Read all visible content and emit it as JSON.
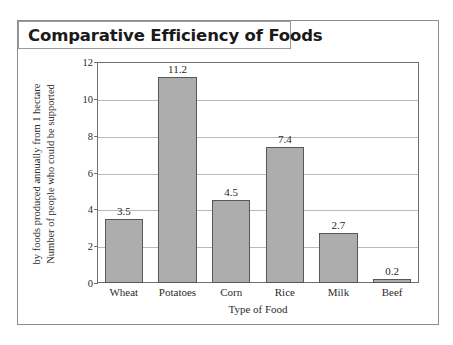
{
  "chart_data": {
    "type": "bar",
    "title": "Comparative Efficiency of Foods",
    "xlabel": "Type of Food",
    "ylabel": "Number of people who could be supported by foods produced annually from 1 hectare",
    "ylabel_lines": [
      "Number of people who could be supported",
      "by foods produced annually from 1 hectare"
    ],
    "categories": [
      "Wheat",
      "Potatoes",
      "Corn",
      "Rice",
      "Milk",
      "Beef"
    ],
    "values": [
      3.5,
      11.2,
      4.5,
      7.4,
      2.7,
      0.2
    ],
    "value_labels": [
      "3.5",
      "11.2",
      "4.5",
      "7.4",
      "2.7",
      "0.2"
    ],
    "ylim": [
      0,
      12
    ],
    "yticks": [
      0,
      2,
      4,
      6,
      8,
      10,
      12
    ],
    "ytick_labels": [
      "0",
      "2",
      "4",
      "6",
      "8",
      "10",
      "12"
    ],
    "grid": true,
    "grid_axis": "y",
    "legend": false,
    "bar_color": "#adadad",
    "bar_edge_color": "#575757",
    "gridline_color": "#b9b9b9",
    "axis_color": "#6f6f6f",
    "text_color": "#2b2b2b",
    "background": "#ffffff"
  }
}
